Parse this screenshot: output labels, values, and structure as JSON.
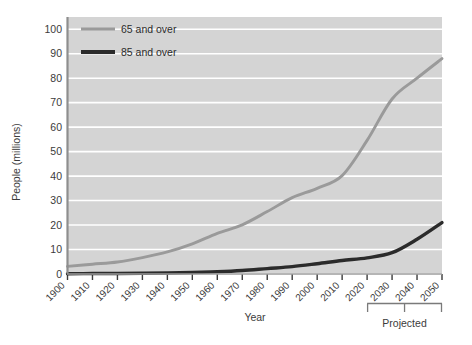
{
  "chart_data": {
    "type": "line",
    "title": "",
    "xlabel": "Year",
    "ylabel": "People (millions)",
    "x": [
      1900,
      1910,
      1920,
      1930,
      1940,
      1950,
      1960,
      1970,
      1980,
      1990,
      2000,
      2010,
      2020,
      2030,
      2040,
      2050
    ],
    "categories": [
      "1900",
      "1910",
      "1920",
      "1930",
      "1940",
      "1950",
      "1960",
      "1970",
      "1980",
      "1990",
      "2000",
      "2010",
      "2020",
      "2030",
      "2040",
      "2050"
    ],
    "series": [
      {
        "name": "65 and over",
        "color": "#9a9a9a",
        "values": [
          3.1,
          4.0,
          4.9,
          6.7,
          9.0,
          12.3,
          16.6,
          20.1,
          25.5,
          31.2,
          35.0,
          40.2,
          54.6,
          71.5,
          80.0,
          88.0
        ]
      },
      {
        "name": "85 and over",
        "color": "#2b2b2b",
        "values": [
          0.1,
          0.2,
          0.2,
          0.3,
          0.4,
          0.6,
          0.9,
          1.4,
          2.2,
          3.0,
          4.2,
          5.5,
          6.6,
          8.7,
          14.2,
          21.0
        ]
      }
    ],
    "ylim": [
      0,
      105
    ],
    "yticks": [
      0,
      10,
      20,
      30,
      40,
      50,
      60,
      70,
      80,
      90,
      100
    ],
    "ytick_labels": [
      "0",
      "10",
      "20",
      "30",
      "40",
      "50",
      "60",
      "70",
      "80",
      "90",
      "100"
    ],
    "xlim": [
      1900,
      2050
    ],
    "grid": true,
    "grid_color": "#ffffff",
    "plot_background": "#d4d4d4",
    "legend_position": "top-left",
    "legend_entries": [
      "65 and over",
      "85 and over"
    ],
    "annotation": {
      "label": "Projected",
      "bracket_start_year": 2020,
      "bracket_end_year": 2050
    }
  }
}
